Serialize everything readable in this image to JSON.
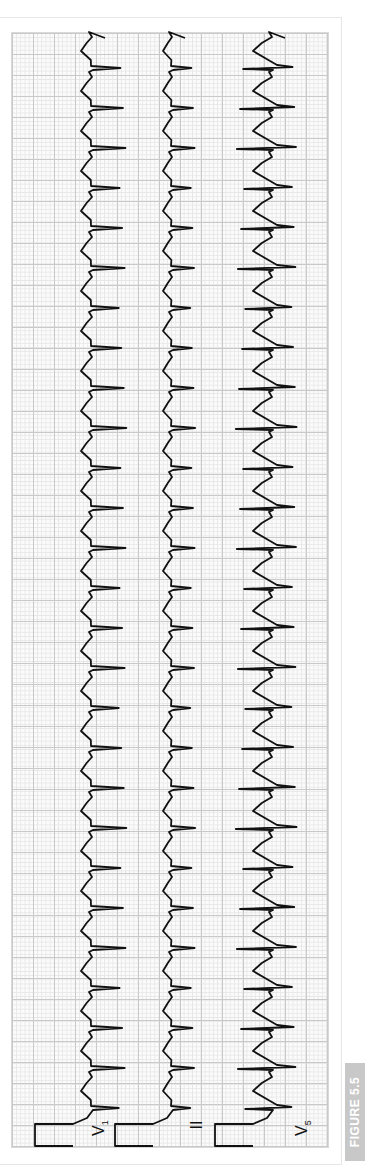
{
  "figure": {
    "label": "FIGURE 5.5",
    "orientation": "rotated 90° counter-clockwise",
    "colors": {
      "trace": "#111111",
      "grid_major": "#c9c9c9",
      "grid_minor": "#e7e7e7",
      "tag_bg": "#c8c8c8",
      "tag_text": "#ffffff"
    }
  },
  "leads": [
    {
      "name": "V",
      "sub": "1",
      "baseline_x": 95,
      "qrs_dir": 1,
      "qrs_amp": 28,
      "twave": 14
    },
    {
      "name": "II",
      "sub": "",
      "baseline_x": 175,
      "qrs_dir": 1,
      "qrs_amp": 18,
      "twave": 12
    },
    {
      "name": "V",
      "sub": "5",
      "baseline_x": 275,
      "qrs_dir": -1,
      "qrs_amp": 35,
      "twave": 22
    }
  ],
  "rhythm": {
    "beat_count": 27,
    "first_beat_y": 1108,
    "beat_spacing_px": 40,
    "description": "Regular narrow-complex tachycardia"
  },
  "calibration": {
    "pulse_height_px": 40,
    "pulse_width_px": 22
  }
}
